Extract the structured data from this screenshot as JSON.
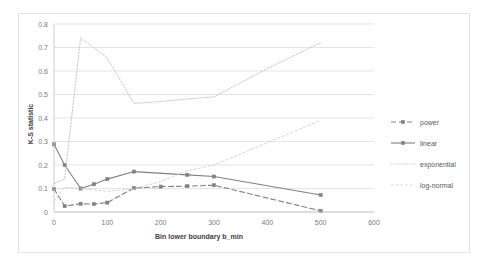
{
  "chart_data": {
    "type": "line",
    "title": "",
    "xlabel": "Bin lower boundary b_min",
    "ylabel": "K-S statistic",
    "xlim": [
      0,
      600
    ],
    "ylim": [
      0,
      0.8
    ],
    "xticks": [
      0,
      100,
      200,
      300,
      400,
      500,
      600
    ],
    "xtick_labels": [
      "0",
      "100",
      "200",
      "300",
      "400",
      "500",
      "600"
    ],
    "yticks": [
      0,
      0.1,
      0.2,
      0.3,
      0.4,
      0.5,
      0.6,
      0.7,
      0.8
    ],
    "ytick_labels": [
      "0",
      "0.1",
      "0.2",
      "0.3",
      "0.4",
      "0.5",
      "0.6",
      "0.7",
      "0.8"
    ],
    "grid": "horizontal",
    "legend_position": "right",
    "series": [
      {
        "name": "power",
        "style": "dashed-marker",
        "color": "#808080",
        "x": [
          0,
          20,
          50,
          75,
          100,
          150,
          200,
          250,
          300,
          500
        ],
        "y": [
          0.098,
          0.025,
          0.035,
          0.034,
          0.04,
          0.102,
          0.108,
          0.11,
          0.114,
          0.005
        ]
      },
      {
        "name": "linear",
        "style": "solid-marker",
        "color": "#808080",
        "x": [
          0,
          20,
          50,
          75,
          100,
          150,
          250,
          300,
          500
        ],
        "y": [
          0.288,
          0.2,
          0.1,
          0.118,
          0.14,
          0.172,
          0.158,
          0.151,
          0.072
        ]
      },
      {
        "name": "exponential",
        "style": "dotted",
        "color": "#c0c0c0",
        "x": [
          0,
          20,
          50,
          100,
          150,
          200,
          250,
          300,
          400,
          500
        ],
        "y": [
          0.12,
          0.14,
          0.742,
          0.655,
          0.462,
          0.47,
          0.481,
          0.49,
          0.61,
          0.72
        ]
      },
      {
        "name": "log-normal",
        "style": "fine-dash",
        "color": "#cfcfcf",
        "x": [
          0,
          20,
          50,
          100,
          150,
          200,
          250,
          300,
          400,
          500
        ],
        "y": [
          0.046,
          0.105,
          0.1,
          0.088,
          0.098,
          0.13,
          0.175,
          0.2,
          0.295,
          0.39
        ]
      }
    ]
  },
  "legend": {
    "items": [
      {
        "label": "power"
      },
      {
        "label": "linear"
      },
      {
        "label": "exponential"
      },
      {
        "label": "log-normal"
      }
    ]
  }
}
